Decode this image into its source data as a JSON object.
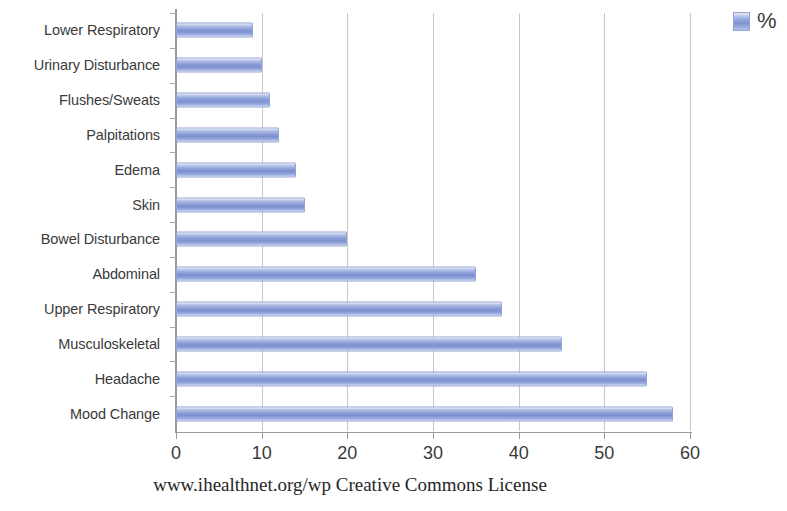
{
  "chart_data": {
    "type": "bar",
    "orientation": "horizontal",
    "title": "",
    "xlabel": "",
    "ylabel": "",
    "xlim": [
      0,
      60
    ],
    "xticks": [
      0,
      10,
      20,
      30,
      40,
      50,
      60
    ],
    "grid": true,
    "legend_position": "top-right",
    "series": [
      {
        "name": "%",
        "color": "#8c9fd8",
        "values": [
          58,
          55,
          45,
          38,
          35,
          20,
          15,
          14,
          12,
          11,
          10,
          9
        ]
      }
    ],
    "categories": [
      "Mood Change",
      "Headache",
      "Musculoskeletal",
      "Upper Respiratory",
      "Abdominal",
      "Bowel Disturbance",
      "Skin",
      "Edema",
      "Palpitations",
      "Flushes/Sweats",
      "Urinary Disturbance",
      "Lower Respiratory"
    ],
    "legend": [
      {
        "label": "%",
        "color": "#8c9fd8"
      }
    ],
    "caption": "www.ihealthnet.org/wp Creative Commons License"
  },
  "colors": {
    "bar": "#8c9fd8",
    "bar_border": "#93a3d6",
    "gridline": "#c8c8c8",
    "axis": "#9a9a9a",
    "text": "#3a3a3a",
    "background": "#ffffff"
  }
}
